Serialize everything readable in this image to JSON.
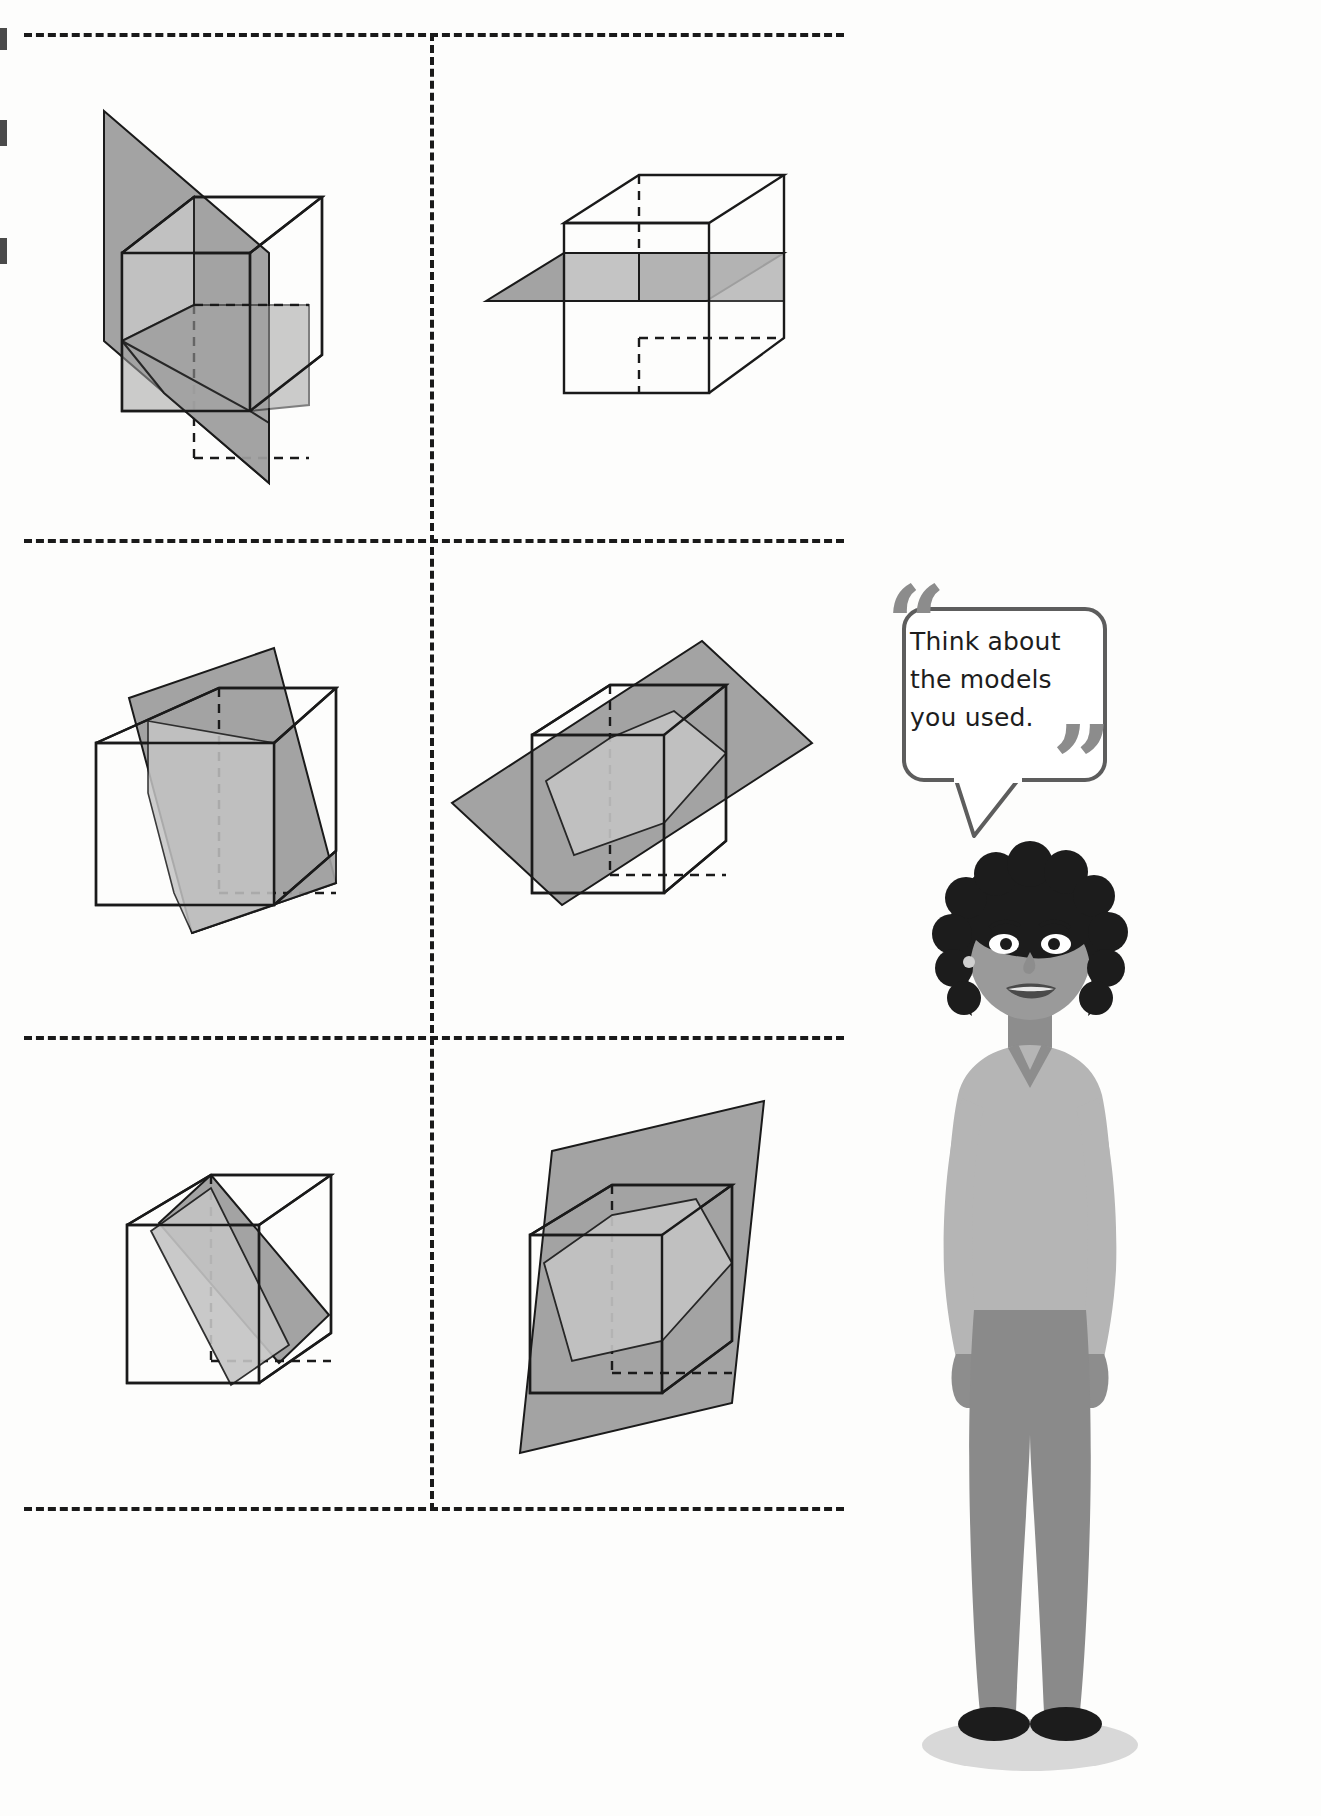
{
  "page": {
    "background_color": "#fdfdfc"
  },
  "palette": {
    "plane_dark": "#a3a3a3",
    "plane_light": "#c4c4c4",
    "outline": "#1a1a1a",
    "dashed_border": "#1a1a1a",
    "bubble_border": "#5d5d5d",
    "quote_mark": "#8c8c8c",
    "skin": "#9a9a9a",
    "hair": "#1c1c1c",
    "top": "#b5b5b5",
    "pants": "#8a8a8a",
    "shoe": "#1c1c1c",
    "shadow": "#d8d8d8"
  },
  "speech_bubble": {
    "name": "hint-callout",
    "lines": [
      "Think about",
      "the models",
      "you used."
    ],
    "text": "Think about the models you used.",
    "open_quote": "“",
    "close_quote": "”"
  },
  "character": {
    "name": "teacher-illustration",
    "description": "Woman with curly dark hair, light sweater, grey trousers, black flats"
  },
  "grid": {
    "rows": 3,
    "columns": 2,
    "border_style": "dashed",
    "cells": [
      {
        "index": 1,
        "position": "top-left",
        "name": "cube-vertical-diagonal-plane",
        "label": "Cube with vertical plane cutting diagonally through opposite edges",
        "plane_orientation": "vertical-diagonal",
        "cross_section": "rectangle"
      },
      {
        "index": 2,
        "position": "top-right",
        "name": "cube-horizontal-plane",
        "label": "Cube with horizontal plane parallel to the bases",
        "plane_orientation": "horizontal",
        "cross_section": "square"
      },
      {
        "index": 3,
        "position": "middle-left",
        "name": "cube-tilted-vertical-plane",
        "label": "Cube with steeply tilted plane slicing top to bottom",
        "plane_orientation": "tilted-vertical",
        "cross_section": "quadrilateral"
      },
      {
        "index": 4,
        "position": "middle-right",
        "name": "cube-oblique-plane-large",
        "label": "Cube with large oblique plane cutting corner to corner",
        "plane_orientation": "oblique",
        "cross_section": "hexagon"
      },
      {
        "index": 5,
        "position": "bottom-left",
        "name": "cube-narrow-diagonal-band",
        "label": "Cube with narrow diagonal plane band crossing the face",
        "plane_orientation": "diagonal-band",
        "cross_section": "rectangle"
      },
      {
        "index": 6,
        "position": "bottom-right",
        "name": "cube-oblique-plane-hexagon",
        "label": "Cube with oblique plane producing a hexagonal cross-section",
        "plane_orientation": "oblique-tilted",
        "cross_section": "hexagon"
      }
    ]
  }
}
